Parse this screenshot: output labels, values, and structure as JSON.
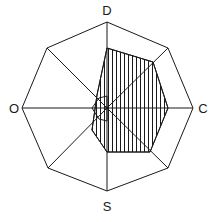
{
  "figure": {
    "type": "geometric-diagram",
    "canvas": {
      "width": 218,
      "height": 222
    },
    "center": {
      "x": 107,
      "y": 108
    },
    "colors": {
      "background": "#ffffff",
      "stroke": "#1a1a1a",
      "hatch": "#1a1a1a",
      "label": "#1a1a1a"
    },
    "stroke_width": 1,
    "hatch": {
      "pattern": "vertical-lines",
      "spacing_px": 4,
      "line_width": 1
    }
  },
  "labels": {
    "top": "D",
    "right": "C",
    "bottom": "S",
    "left": "O"
  },
  "label_positions": {
    "top": {
      "x": 107,
      "y": 15
    },
    "right": {
      "x": 203,
      "y": 113
    },
    "bottom": {
      "x": 107,
      "y": 211
    },
    "left": {
      "x": 14,
      "y": 113
    }
  },
  "outer_polygon": {
    "name": "octagon",
    "sides": 8,
    "points": "107,22 168,48 193,108 168,168 107,191 48,168 22,108 47,48"
  },
  "inner_polygon": {
    "name": "hatched-heptagon",
    "points": "107,48 153,62 168,108 150,152 107,152 92,130 97,95"
  },
  "center_polygon": {
    "name": "small-core-polygon",
    "points": "107,96 99,98 92,108 99,119 107,121"
  },
  "spokes": [
    {
      "name": "spoke-to-top",
      "x1": 107,
      "y1": 108,
      "x2": 107,
      "y2": 22
    },
    {
      "name": "spoke-to-upper-right",
      "x1": 107,
      "y1": 108,
      "x2": 168,
      "y2": 48
    },
    {
      "name": "spoke-to-right",
      "x1": 107,
      "y1": 108,
      "x2": 193,
      "y2": 108
    },
    {
      "name": "spoke-to-lower-right",
      "x1": 107,
      "y1": 108,
      "x2": 168,
      "y2": 168
    },
    {
      "name": "spoke-to-bottom",
      "x1": 107,
      "y1": 108,
      "x2": 107,
      "y2": 191
    },
    {
      "name": "spoke-to-lower-left",
      "x1": 107,
      "y1": 108,
      "x2": 48,
      "y2": 168
    },
    {
      "name": "spoke-to-left",
      "x1": 107,
      "y1": 108,
      "x2": 22,
      "y2": 108
    },
    {
      "name": "spoke-to-upper-left",
      "x1": 107,
      "y1": 108,
      "x2": 47,
      "y2": 48
    }
  ]
}
